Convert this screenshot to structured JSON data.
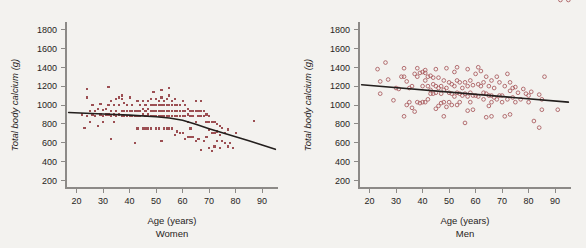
{
  "figure": {
    "background_color": "#f3f2ef",
    "marker_color": "#9c4f53",
    "line_color": "#231f1d",
    "axis_color": "#8c8a87"
  },
  "chart_data": [
    {
      "type": "scatter",
      "title": "",
      "panel_caption": "Women",
      "xlabel": "Age (years)",
      "ylabel": "Total body calcium (g)",
      "xlim": [
        16,
        96
      ],
      "ylim": [
        120,
        1880
      ],
      "xticks": [
        20,
        30,
        40,
        50,
        60,
        70,
        80,
        90
      ],
      "yticks": [
        200,
        400,
        600,
        800,
        1000,
        1200,
        1400,
        1600,
        1800
      ],
      "grid": false,
      "legend": "none",
      "marker": "filled-square",
      "series_name": "Women",
      "fit_line": {
        "style": "curved-regression",
        "points": [
          [
            17,
            920
          ],
          [
            30,
            905
          ],
          [
            40,
            893
          ],
          [
            50,
            875
          ],
          [
            55,
            862
          ],
          [
            60,
            838
          ],
          [
            65,
            795
          ],
          [
            70,
            748
          ],
          [
            75,
            705
          ],
          [
            80,
            663
          ],
          [
            85,
            620
          ],
          [
            90,
            575
          ],
          [
            95,
            530
          ]
        ]
      },
      "x": [
        22,
        23,
        24,
        24,
        24,
        25,
        25,
        26,
        26,
        27,
        27,
        28,
        28,
        29,
        29,
        30,
        30,
        30,
        31,
        31,
        32,
        32,
        32,
        33,
        33,
        33,
        33,
        34,
        34,
        34,
        35,
        35,
        35,
        36,
        36,
        36,
        37,
        37,
        37,
        37,
        38,
        38,
        38,
        39,
        39,
        39,
        40,
        40,
        40,
        41,
        41,
        41,
        42,
        42,
        42,
        43,
        43,
        43,
        43,
        44,
        44,
        44,
        45,
        45,
        45,
        45,
        46,
        46,
        46,
        46,
        47,
        47,
        47,
        47,
        48,
        48,
        48,
        48,
        48,
        49,
        49,
        49,
        49,
        50,
        50,
        50,
        50,
        50,
        51,
        51,
        51,
        51,
        51,
        52,
        52,
        52,
        52,
        52,
        52,
        53,
        53,
        53,
        53,
        53,
        54,
        54,
        54,
        54,
        54,
        55,
        55,
        55,
        55,
        55,
        55,
        56,
        56,
        56,
        56,
        56,
        57,
        57,
        57,
        57,
        57,
        58,
        58,
        58,
        58,
        59,
        59,
        59,
        59,
        60,
        60,
        60,
        60,
        61,
        61,
        61,
        61,
        62,
        62,
        62,
        62,
        63,
        63,
        63,
        63,
        64,
        64,
        64,
        65,
        65,
        65,
        65,
        66,
        66,
        66,
        67,
        67,
        67,
        67,
        68,
        68,
        68,
        69,
        69,
        69,
        70,
        70,
        70,
        70,
        71,
        71,
        71,
        72,
        72,
        72,
        73,
        73,
        73,
        74,
        74,
        74,
        75,
        75,
        76,
        76,
        77,
        77,
        78,
        79,
        80,
        87
      ],
      "y": [
        900,
        760,
        1170,
        1080,
        880,
        940,
        820,
        900,
        1000,
        880,
        940,
        960,
        780,
        900,
        1010,
        950,
        880,
        820,
        960,
        900,
        1190,
        1000,
        900,
        1040,
        940,
        880,
        640,
        900,
        1000,
        820,
        1060,
        940,
        880,
        1080,
        1000,
        900,
        1100,
        1060,
        940,
        880,
        1020,
        940,
        880,
        1000,
        940,
        880,
        1080,
        940,
        880,
        1000,
        940,
        880,
        940,
        880,
        600,
        1040,
        940,
        880,
        750,
        1000,
        940,
        880,
        1040,
        960,
        900,
        750,
        1000,
        940,
        880,
        750,
        1040,
        960,
        900,
        750,
        1060,
        1000,
        940,
        880,
        750,
        1140,
        1000,
        940,
        880,
        1060,
        1000,
        940,
        880,
        750,
        1040,
        1000,
        940,
        880,
        750,
        1160,
        1080,
        1000,
        940,
        880,
        620,
        1040,
        1000,
        940,
        880,
        750,
        1060,
        1000,
        940,
        880,
        750,
        1180,
        1100,
        1000,
        940,
        880,
        750,
        1040,
        1000,
        940,
        880,
        750,
        1060,
        1000,
        940,
        880,
        680,
        1000,
        940,
        880,
        720,
        1000,
        940,
        880,
        700,
        1040,
        940,
        880,
        700,
        1000,
        940,
        880,
        640,
        960,
        900,
        820,
        660,
        940,
        880,
        750,
        660,
        940,
        880,
        660,
        1040,
        940,
        820,
        620,
        940,
        880,
        640,
        1040,
        940,
        880,
        520,
        940,
        880,
        620,
        900,
        820,
        660,
        880,
        820,
        740,
        540,
        820,
        700,
        510,
        820,
        700,
        560,
        800,
        720,
        620,
        780,
        680,
        540,
        760,
        620,
        700,
        600,
        740,
        560,
        600,
        540,
        700,
        830
      ]
    },
    {
      "type": "scatter",
      "title": "",
      "panel_caption": "Men",
      "xlabel": "Age (years)",
      "ylabel": "Total body calcium (g)",
      "xlim": [
        16,
        96
      ],
      "ylim": [
        120,
        1880
      ],
      "xticks": [
        20,
        30,
        40,
        50,
        60,
        70,
        80,
        90
      ],
      "yticks": [
        200,
        400,
        600,
        800,
        1000,
        1200,
        1400,
        1600,
        1800
      ],
      "grid": false,
      "legend": "none",
      "marker": "open-circle",
      "series_name": "Men",
      "fit_line": {
        "style": "linear-regression",
        "points": [
          [
            17,
            1215
          ],
          [
            95,
            1030
          ]
        ]
      },
      "x": [
        23,
        24,
        24,
        26,
        27,
        29,
        30,
        31,
        32,
        33,
        33,
        33,
        34,
        34,
        35,
        35,
        36,
        36,
        37,
        37,
        38,
        38,
        38,
        39,
        39,
        40,
        40,
        40,
        41,
        41,
        41,
        41,
        42,
        42,
        42,
        43,
        43,
        43,
        44,
        44,
        44,
        45,
        45,
        45,
        45,
        46,
        46,
        46,
        47,
        47,
        47,
        48,
        48,
        48,
        48,
        49,
        49,
        49,
        50,
        50,
        50,
        51,
        51,
        51,
        52,
        52,
        52,
        53,
        53,
        53,
        53,
        54,
        54,
        54,
        55,
        55,
        56,
        56,
        56,
        57,
        57,
        57,
        57,
        58,
        58,
        58,
        59,
        59,
        59,
        60,
        60,
        61,
        61,
        61,
        62,
        62,
        63,
        63,
        63,
        64,
        64,
        64,
        65,
        65,
        65,
        66,
        66,
        66,
        66,
        67,
        67,
        68,
        68,
        69,
        69,
        70,
        70,
        71,
        71,
        72,
        72,
        73,
        73,
        73,
        74,
        74,
        75,
        75,
        76,
        77,
        78,
        79,
        80,
        80,
        81,
        82,
        84,
        84,
        85,
        85,
        86,
        91,
        92,
        95
      ],
      "y": [
        1380,
        1250,
        1120,
        1450,
        1270,
        1050,
        1180,
        1170,
        1300,
        1390,
        1300,
        880,
        1250,
        1000,
        1180,
        1030,
        1200,
        970,
        1330,
        930,
        1390,
        1300,
        1030,
        1340,
        1020,
        1350,
        1200,
        1030,
        1370,
        1340,
        1260,
        1030,
        1300,
        1200,
        1060,
        1310,
        1160,
        1120,
        1290,
        1220,
        1120,
        1380,
        1200,
        1130,
        960,
        1290,
        1180,
        990,
        1200,
        1120,
        1020,
        1260,
        1160,
        1030,
        880,
        1390,
        1180,
        980,
        1240,
        1130,
        1030,
        1220,
        1120,
        1000,
        1350,
        1200,
        1090,
        1400,
        1260,
        1130,
        1000,
        1240,
        1120,
        1030,
        1180,
        1100,
        1240,
        1120,
        810,
        1380,
        1200,
        1090,
        940,
        1260,
        1130,
        1030,
        1210,
        1100,
        950,
        1330,
        1100,
        1400,
        1220,
        1090,
        1360,
        1200,
        1130,
        1060,
        1240,
        1120,
        870,
        1300,
        1100,
        990,
        1200,
        1100,
        1030,
        880,
        1260,
        1080,
        1180,
        1060,
        1300,
        1100,
        1240,
        1030,
        1100,
        880,
        1200,
        1060,
        1330,
        1150,
        900,
        1240,
        1080,
        1180,
        1030,
        1190,
        1130,
        1060,
        1170,
        1120,
        1030,
        1100,
        1140,
        830,
        1110,
        760,
        950,
        1060,
        1300,
        950
      ]
    }
  ]
}
